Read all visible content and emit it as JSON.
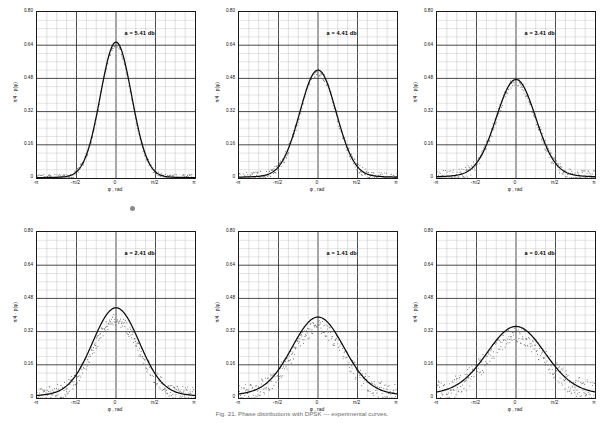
{
  "figure": {
    "caption": "Fig. 21.  Phase distributions with DPSK --- experimental curves.",
    "panel_width": 201,
    "panel_height": 210
  },
  "axes": {
    "ylabel": "π/4 · p(φ)",
    "xlabel": "φ , rad",
    "ytick_labels": [
      "0",
      "0.16",
      "0.32",
      "0.48",
      "0.64",
      "0.80"
    ],
    "ytick_values": [
      0,
      0.16,
      0.32,
      0.48,
      0.64,
      0.8
    ],
    "xtick_labels": [
      "-π",
      "-π/2",
      "0",
      "π/2",
      "π"
    ],
    "xtick_values": [
      -3.14159,
      -1.5708,
      0,
      1.5708,
      3.14159
    ],
    "ylim": [
      0,
      0.8
    ],
    "xlim": [
      -3.14159,
      3.14159
    ],
    "grid": true
  },
  "chart_data": [
    {
      "type": "line",
      "panel": 1,
      "title": "",
      "annotation": "a = 5.41 db",
      "a_db": 5.41,
      "xlabel": "φ , rad",
      "ylabel": "π/4 · p(φ)",
      "ylim": [
        0,
        0.8
      ],
      "xlim": [
        -3.14159,
        3.14159
      ],
      "peak": 0.655,
      "width": 0.62,
      "floor": 0.004,
      "scatter_amp": 0.012,
      "series": [
        {
          "name": "theoretical",
          "style": "solid-line"
        },
        {
          "name": "experimental",
          "style": "scatter-points"
        }
      ],
      "x": [
        -3.14159,
        -2.74889,
        -2.35619,
        -1.9635,
        -1.5708,
        -1.1781,
        -0.7854,
        -0.3927,
        0,
        0.3927,
        0.7854,
        1.1781,
        1.5708,
        1.9635,
        2.35619,
        2.74889,
        3.14159
      ],
      "values": [
        0.004,
        0.005,
        0.007,
        0.012,
        0.026,
        0.072,
        0.215,
        0.5,
        0.655,
        0.5,
        0.215,
        0.072,
        0.026,
        0.012,
        0.007,
        0.005,
        0.004
      ]
    },
    {
      "type": "line",
      "panel": 2,
      "annotation": "a = 4.41 db",
      "a_db": 4.41,
      "ylim": [
        0,
        0.8
      ],
      "xlim": [
        -3.14159,
        3.14159
      ],
      "peak": 0.52,
      "width": 0.72,
      "floor": 0.008,
      "scatter_amp": 0.018,
      "series": [
        {
          "name": "theoretical",
          "style": "solid-line"
        },
        {
          "name": "experimental",
          "style": "scatter-points"
        }
      ],
      "x": [
        -3.14159,
        -2.74889,
        -2.35619,
        -1.9635,
        -1.5708,
        -1.1781,
        -0.7854,
        -0.3927,
        0,
        0.3927,
        0.7854,
        1.1781,
        1.5708,
        1.9635,
        2.35619,
        2.74889,
        3.14159
      ],
      "values": [
        0.008,
        0.01,
        0.014,
        0.023,
        0.046,
        0.108,
        0.246,
        0.43,
        0.52,
        0.43,
        0.246,
        0.108,
        0.046,
        0.023,
        0.014,
        0.01,
        0.008
      ]
    },
    {
      "type": "line",
      "panel": 3,
      "annotation": "a = 3.41 db",
      "a_db": 3.41,
      "ylim": [
        0,
        0.8
      ],
      "xlim": [
        -3.14159,
        3.14159
      ],
      "peak": 0.475,
      "width": 0.78,
      "floor": 0.012,
      "scatter_amp": 0.022,
      "series": [
        {
          "name": "theoretical",
          "style": "solid-line"
        },
        {
          "name": "experimental",
          "style": "scatter-points"
        }
      ],
      "x": [
        -3.14159,
        -2.74889,
        -2.35619,
        -1.9635,
        -1.5708,
        -1.1781,
        -0.7854,
        -0.3927,
        0,
        0.3927,
        0.7854,
        1.1781,
        1.5708,
        1.9635,
        2.35619,
        2.74889,
        3.14159
      ],
      "values": [
        0.012,
        0.015,
        0.021,
        0.034,
        0.062,
        0.13,
        0.258,
        0.406,
        0.475,
        0.406,
        0.258,
        0.13,
        0.062,
        0.034,
        0.021,
        0.015,
        0.012
      ]
    },
    {
      "type": "line",
      "panel": 4,
      "annotation": "a = 2.41 db",
      "a_db": 2.41,
      "ylim": [
        0,
        0.8
      ],
      "xlim": [
        -3.14159,
        3.14159
      ],
      "peak": 0.435,
      "width": 0.92,
      "floor": 0.02,
      "scatter_amp": 0.03,
      "series": [
        {
          "name": "theoretical",
          "style": "solid-line"
        },
        {
          "name": "experimental",
          "style": "scatter-points"
        }
      ],
      "x": [
        -3.14159,
        -2.74889,
        -2.35619,
        -1.9635,
        -1.5708,
        -1.1781,
        -0.7854,
        -0.3927,
        0,
        0.3927,
        0.7854,
        1.1781,
        1.5708,
        1.9635,
        2.35619,
        2.74889,
        3.14159
      ],
      "values": [
        0.02,
        0.025,
        0.035,
        0.055,
        0.092,
        0.168,
        0.28,
        0.386,
        0.435,
        0.386,
        0.28,
        0.168,
        0.092,
        0.055,
        0.035,
        0.025,
        0.02
      ]
    },
    {
      "type": "line",
      "panel": 5,
      "annotation": "a = 1.41 db",
      "a_db": 1.41,
      "ylim": [
        0,
        0.8
      ],
      "xlim": [
        -3.14159,
        3.14159
      ],
      "peak": 0.39,
      "width": 1.02,
      "floor": 0.03,
      "scatter_amp": 0.036,
      "series": [
        {
          "name": "theoretical",
          "style": "solid-line"
        },
        {
          "name": "experimental",
          "style": "scatter-points"
        }
      ],
      "x": [
        -3.14159,
        -2.74889,
        -2.35619,
        -1.9635,
        -1.5708,
        -1.1781,
        -0.7854,
        -0.3927,
        0,
        0.3927,
        0.7854,
        1.1781,
        1.5708,
        1.9635,
        2.35619,
        2.74889,
        3.14159
      ],
      "values": [
        0.03,
        0.036,
        0.049,
        0.071,
        0.11,
        0.18,
        0.272,
        0.355,
        0.39,
        0.355,
        0.272,
        0.18,
        0.11,
        0.071,
        0.049,
        0.036,
        0.03
      ]
    },
    {
      "type": "line",
      "panel": 6,
      "annotation": "a = 0.41 db",
      "a_db": 0.41,
      "ylim": [
        0,
        0.8
      ],
      "xlim": [
        -3.14159,
        3.14159
      ],
      "peak": 0.345,
      "width": 1.12,
      "floor": 0.042,
      "scatter_amp": 0.042,
      "series": [
        {
          "name": "theoretical",
          "style": "solid-line"
        },
        {
          "name": "experimental",
          "style": "scatter-points"
        }
      ],
      "x": [
        -3.14159,
        -2.74889,
        -2.35619,
        -1.9635,
        -1.5708,
        -1.1781,
        -0.7854,
        -0.3927,
        0,
        0.3927,
        0.7854,
        1.1781,
        1.5708,
        1.9635,
        2.35619,
        2.74889,
        3.14159
      ],
      "values": [
        0.042,
        0.05,
        0.065,
        0.09,
        0.13,
        0.196,
        0.268,
        0.325,
        0.345,
        0.325,
        0.268,
        0.196,
        0.13,
        0.09,
        0.065,
        0.05,
        0.042
      ]
    }
  ]
}
